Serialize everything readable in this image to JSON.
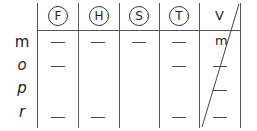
{
  "table": {
    "columns": [
      {
        "id": "F",
        "label": "F",
        "style": "circled"
      },
      {
        "id": "H",
        "label": "H",
        "style": "circled"
      },
      {
        "id": "S",
        "label": "S",
        "style": "circled"
      },
      {
        "id": "T",
        "label": "T",
        "style": "circled"
      },
      {
        "id": "V",
        "label": "V",
        "style": "plain"
      }
    ],
    "rows": [
      {
        "label": "m",
        "cells": {
          "F": "—",
          "H": "—",
          "S": "—",
          "T": "—",
          "V": "m"
        }
      },
      {
        "label": "o",
        "cells": {
          "F": "—",
          "H": "",
          "S": "",
          "T": "—",
          "V": "—"
        }
      },
      {
        "label": "p",
        "cells": {
          "F": "",
          "H": "",
          "S": "",
          "T": "",
          "V": "—"
        }
      },
      {
        "label": "r",
        "cells": {
          "F": "—",
          "H": "—",
          "S": "",
          "T": "—",
          "V": "—"
        }
      }
    ],
    "diagonal_in_column": "V"
  }
}
